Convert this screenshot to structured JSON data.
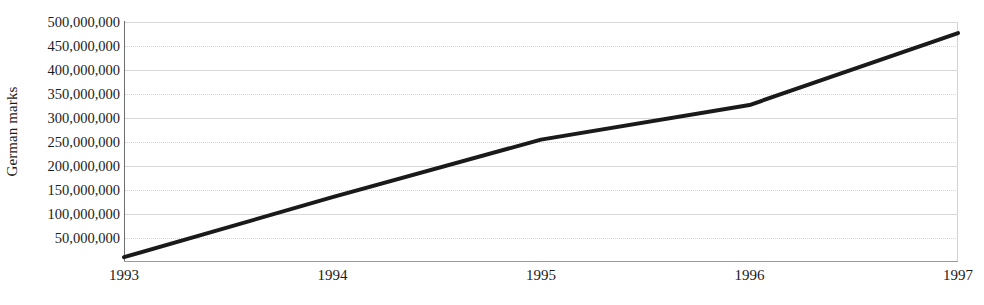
{
  "chart_data": {
    "type": "line",
    "title": "",
    "subtitle": "",
    "xlabel": "",
    "ylabel": "German marks",
    "x": [
      1993,
      1994,
      1995,
      1996,
      1997
    ],
    "categories": [
      "1993",
      "1994",
      "1995",
      "1996",
      "1997"
    ],
    "values": [
      10000000,
      135000000,
      255000000,
      327000000,
      477000000
    ],
    "series": [
      {
        "name": "German marks",
        "values": [
          10000000,
          135000000,
          255000000,
          327000000,
          477000000
        ]
      }
    ],
    "xlim": [
      1993,
      1997
    ],
    "ylim": [
      0,
      500000000
    ],
    "ytick_values": [
      50000000,
      100000000,
      150000000,
      200000000,
      250000000,
      300000000,
      350000000,
      400000000,
      450000000,
      500000000
    ],
    "ytick_labels": [
      "50,000,000",
      "100,000,000",
      "150,000,000",
      "200,000,000",
      "250,000,000",
      "300,000,000",
      "350,000,000",
      "400,000,000",
      "450,000,000",
      "500,000,000"
    ],
    "xtick_labels": [
      "1993",
      "1994",
      "1995",
      "1996",
      "1997"
    ],
    "grid": true,
    "grid_axis": "y",
    "legend": false,
    "legend_position": "none",
    "line_color": "#1a1a1a",
    "line_width": 4,
    "grid_color": "#d8d8d8",
    "background_color": "#ffffff",
    "text_color": "#1b1b1b",
    "annotations": []
  }
}
